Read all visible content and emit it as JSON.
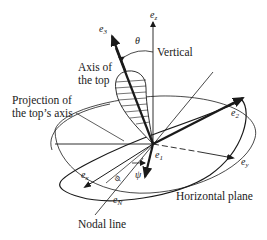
{
  "diagram": {
    "labels": {
      "axis_of_top_line1": "Axis of",
      "axis_of_top_line2": "the top",
      "projection_line1": "Projection of",
      "projection_line2": "the top’s axis",
      "vertical": "Vertical",
      "horizontal_plane": "Horizontal plane",
      "nodal_line": "Nodal line"
    },
    "vectors": {
      "e3": {
        "base": "e",
        "sub": "3"
      },
      "ez": {
        "base": "e",
        "sub": "z"
      },
      "e2": {
        "base": "e",
        "sub": "2"
      },
      "e1": {
        "base": "e",
        "sub": "1"
      },
      "ex": {
        "base": "e",
        "sub": "x"
      },
      "ey": {
        "base": "e",
        "sub": "y"
      },
      "eN": {
        "base": "e",
        "sub": "N"
      }
    },
    "angles": {
      "theta": "θ",
      "phi": "φ",
      "psi": "ψ"
    },
    "colors": {
      "ink": "#1a1a1a",
      "background": "#ffffff"
    }
  }
}
